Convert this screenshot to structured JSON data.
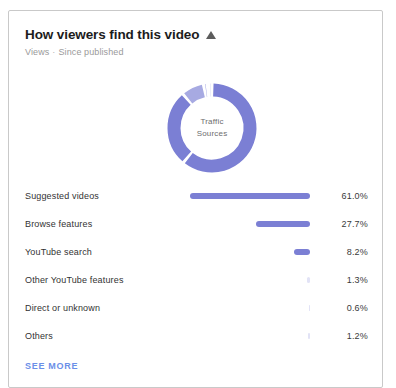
{
  "card": {
    "header": {
      "title": "How viewers find this video",
      "trend_icon": "triangle-up-icon",
      "metric": "Views",
      "separator": "·",
      "period": "Since published"
    },
    "donut": {
      "center_line1": "Traffic",
      "center_line2": "Sources",
      "primary_color": "#7b7fd4",
      "secondary_color": "#a7aae2",
      "track_color": "#ffffff"
    },
    "see_more_label": "SEE MORE",
    "see_more_color": "#6b8fe8"
  },
  "chart_data": {
    "type": "pie",
    "title": "How viewers find this video",
    "subtitle": "Views · Since published",
    "center_label": "Traffic Sources",
    "unit": "%",
    "categories": [
      "Suggested videos",
      "Browse features",
      "YouTube search",
      "Other YouTube features",
      "Direct or unknown",
      "Others"
    ],
    "values": [
      61.0,
      27.7,
      8.2,
      1.3,
      0.6,
      1.2
    ],
    "value_labels": [
      "61.0%",
      "27.7%",
      "8.2%",
      "1.3%",
      "0.6%",
      "1.2%"
    ],
    "bar_max": 61.0,
    "grid": false,
    "legend": "none",
    "rows": [
      {
        "label": "Suggested videos",
        "value": 61.0,
        "value_label": "61.0%"
      },
      {
        "label": "Browse features",
        "value": 27.7,
        "value_label": "27.7%"
      },
      {
        "label": "YouTube search",
        "value": 8.2,
        "value_label": "8.2%"
      },
      {
        "label": "Other YouTube features",
        "value": 1.3,
        "value_label": "1.3%"
      },
      {
        "label": "Direct or unknown",
        "value": 0.6,
        "value_label": "0.6%"
      },
      {
        "label": "Others",
        "value": 1.2,
        "value_label": "1.2%"
      }
    ]
  }
}
